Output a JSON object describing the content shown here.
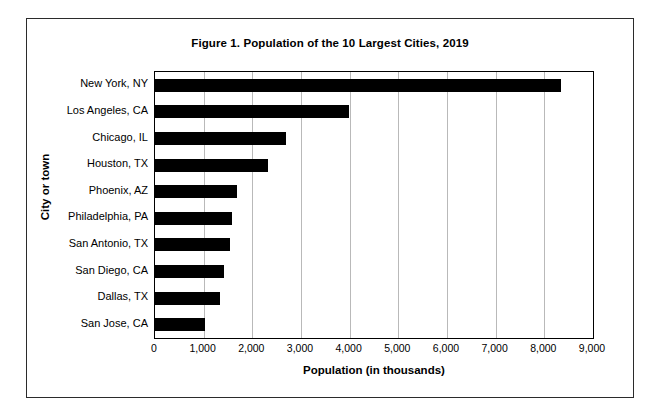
{
  "chart_data": {
    "type": "bar",
    "orientation": "horizontal",
    "title": "Figure 1. Population of the 10 Largest Cities, 2019",
    "xlabel": "Population (in thousands)",
    "ylabel": "City or town",
    "xlim": [
      0,
      9000
    ],
    "xticks": [
      0,
      1000,
      2000,
      3000,
      4000,
      5000,
      6000,
      7000,
      8000,
      9000
    ],
    "xticklabels": [
      "0",
      "1,000",
      "2,000",
      "3,000",
      "4,000",
      "5,000",
      "6,000",
      "7,000",
      "8,000",
      "9,000"
    ],
    "grid": "vertical",
    "legend": "none",
    "bar_color": "#000000",
    "categories": [
      "New York, NY",
      "Los Angeles, CA",
      "Chicago, IL",
      "Houston, TX",
      "Phoenix, AZ",
      "Philadelphia, PA",
      "San Antonio, TX",
      "San Diego, CA",
      "Dallas, TX",
      "San Jose, CA"
    ],
    "values": [
      8337,
      3979,
      2694,
      2320,
      1681,
      1584,
      1547,
      1424,
      1344,
      1021
    ]
  }
}
